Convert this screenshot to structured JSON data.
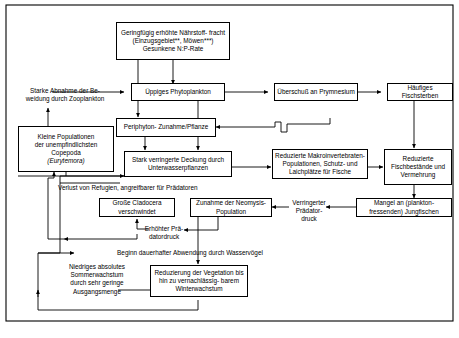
{
  "figure": {
    "kind": "flow-diagram",
    "language": "de",
    "border": "#000000",
    "background": "#ffffff"
  },
  "nodes": {
    "nutrients": "Geringfügig erhöhte Nährstoff-\nfracht (Einzugsgebiet**, Möwen***)\nGesunkene N:P-Rate",
    "phytoplankton": "Üppiges Phytoplankton",
    "prymnesium": "Überschuß an Prymnesium",
    "fishkill": "Häufiges Fischsterben",
    "copepoda_line1": "Kleine Populationen",
    "copepoda_line2": "der unempfindlichsten",
    "copepoda_line3": "Copepoda",
    "copepoda_line4": "(Eurytemora)",
    "periphyton": "Periphyton-\nZunahme/Pflanze",
    "coverage": "Stark verringerte Deckung\ndurch Unterwasserpflanzen",
    "macroinvertebrates": "Reduzierte Makroinvertebraten-\nPopulationen, Schutz- und\nLaichplätze für Fische",
    "fishstocks": "Reduzierte\nFischbestände\nund Vermehrung",
    "cladocera": "Große Cladocera\nverschwindet",
    "neomysis": "Zunahme der\nNeomysis-Population",
    "juvenilefish": "Mangel an (plankton-\nfressenden) Jungfischen",
    "vegetation": "Reduzierung der Vegetation\nbis hin zu vernachlässig-\nbarem Winterwachstum"
  },
  "labels": {
    "grazing": "Starke Abnahme der Be-\nweidung durch Zooplankton",
    "refugia": "Verlust von Refugien, angreifbarer für Prädatoren",
    "predation_increase": "Erhöhter Prä-\ndatordruck",
    "predation_decrease": "Verringerter\nPrädator-\ndruck",
    "waterbirds": "Beginn dauerhafter Abwendung durch Wasservögel",
    "lowgrowth": "Niedriges absolutes\nSommerwachstum\ndurch sehr geringe\nAusgangsmenge"
  }
}
